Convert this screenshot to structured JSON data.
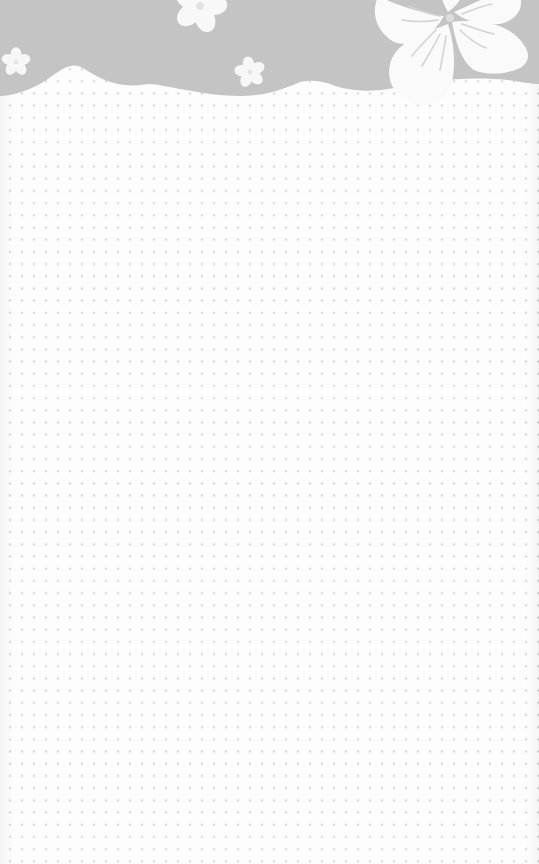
{
  "page": {
    "type": "notepad-background",
    "colors": {
      "header_band": "#c4c4c4",
      "paper": "#fdfdfd",
      "dot": "#cfcfcf",
      "flower": "#fafafa",
      "flower_vein": "#d2d2d2"
    },
    "header": {
      "decoration": "scalloped-edge",
      "flowers": [
        {
          "name": "flower-small-left",
          "cx": 16,
          "cy": 62,
          "r": 14
        },
        {
          "name": "flower-top-center",
          "cx": 200,
          "cy": 8,
          "r": 26
        },
        {
          "name": "flower-small-center",
          "cx": 250,
          "cy": 72,
          "r": 16
        },
        {
          "name": "flower-large-right",
          "cx": 440,
          "cy": 10,
          "r": 80
        }
      ]
    },
    "grid": {
      "style": "dot-grid",
      "spacing_px": 12
    }
  }
}
